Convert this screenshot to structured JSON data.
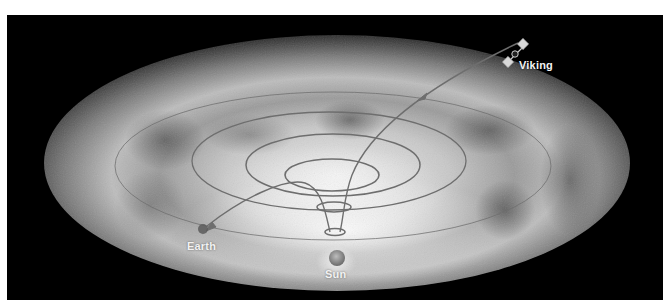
{
  "diagram": {
    "type": "orbital-illustration",
    "labels": {
      "spacecraft": "Viking",
      "planet": "Earth",
      "star": "Sun"
    },
    "colors": {
      "background": "#000000",
      "orbit_lines": "#6e6e6e",
      "labels": "#f2f2f2"
    }
  }
}
